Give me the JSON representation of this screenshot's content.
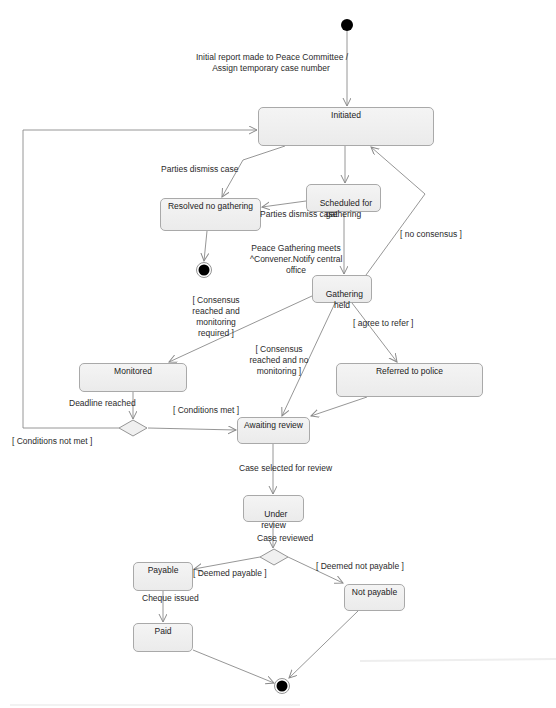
{
  "diagram": {
    "type": "UML state machine",
    "states": {
      "initiated": "Initiated",
      "scheduled": "Scheduled for\ngathering",
      "resolved": "Resolved no gathering",
      "gathering_held": "Gathering\nheld",
      "monitored": "Monitored",
      "referred": "Referred to police",
      "awaiting_review": "Awaiting review",
      "under_review": "Under\nreview",
      "payable": "Payable",
      "not_payable": "Not payable",
      "paid": "Paid"
    },
    "transitions": {
      "initial_report": "Initial report made to Peace Committee /\nAssign temporary case number",
      "parties_dismiss_1": "Parties dismiss case",
      "parties_dismiss_2": "Parties dismiss case",
      "peace_gathering": "Peace Gathering meets\n^Convener.Notify central\noffice",
      "no_consensus": "[ no consensus ]",
      "consensus_monitoring": "[ Consensus\nreached and\nmonitoring\nrequired ]",
      "agree_refer": "[ agree to refer ]",
      "consensus_no_monitoring": "[ Consensus\nreached and no\nmonitoring ]",
      "deadline_reached": "Deadline reached",
      "conditions_met": "[ Conditions met ]",
      "conditions_not_met": "[ Conditions not met ]",
      "case_selected": "Case selected for review",
      "case_reviewed": "Case reviewed",
      "deemed_payable": "[ Deemed payable ]",
      "deemed_not_payable": "[ Deemed not payable ]",
      "cheque_issued": "Cheque issued"
    },
    "colors": {
      "line": "#8a8a8a",
      "state_border": "#a9a9a9",
      "state_fill": "#f0f0f0",
      "node_fill": "#000000"
    }
  }
}
